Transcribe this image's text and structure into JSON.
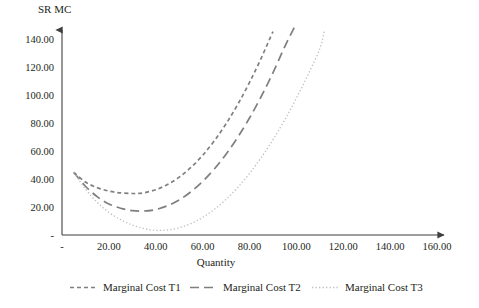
{
  "chart_data": {
    "type": "line",
    "title": "",
    "xlabel": "Quantity",
    "ylabel": "SR MC",
    "xlim": [
      0,
      160
    ],
    "ylim": [
      0,
      150
    ],
    "grid": false,
    "legend_position": "bottom",
    "x_tick_labels": [
      "-",
      "20.00",
      "40.00",
      "60.00",
      "80.00",
      "100.00",
      "120.00",
      "140.00",
      "160.00"
    ],
    "x_tick_values": [
      0,
      20,
      40,
      60,
      80,
      100,
      120,
      140,
      160
    ],
    "y_tick_labels": [
      "-",
      "20.00",
      "40.00",
      "60.00",
      "80.00",
      "100.00",
      "120.00",
      "140.00"
    ],
    "y_tick_values": [
      0,
      20,
      40,
      60,
      80,
      100,
      120,
      140
    ],
    "series": [
      {
        "name": "Marginal Cost T1",
        "dash": "short-dash",
        "color": "#808080",
        "x": [
          5,
          10,
          15,
          20,
          25,
          30,
          32,
          35,
          40,
          45,
          50,
          55,
          60,
          65,
          70,
          75,
          80,
          85,
          90
        ],
        "values": [
          45,
          38,
          34,
          31.5,
          30.2,
          29.8,
          29.8,
          30.3,
          32.5,
          36.2,
          41.5,
          48.5,
          57.2,
          67.6,
          79.8,
          93.8,
          109.5,
          127,
          146
        ]
      },
      {
        "name": "Marginal Cost T2",
        "dash": "long-dash",
        "color": "#7f7f7f",
        "x": [
          5,
          10,
          15,
          20,
          25,
          30,
          35,
          40,
          45,
          50,
          55,
          60,
          65,
          70,
          75,
          80,
          85,
          90,
          95,
          100
        ],
        "values": [
          45,
          35,
          27.5,
          22.3,
          19.2,
          17.5,
          17.2,
          18.3,
          21,
          25.2,
          31,
          38.4,
          47.4,
          58,
          70.2,
          84,
          99.4,
          116.4,
          135,
          152
        ]
      },
      {
        "name": "Marginal Cost T3",
        "dash": "dotted",
        "color": "#bfbfbf",
        "x": [
          5,
          10,
          15,
          20,
          25,
          30,
          35,
          40,
          45,
          50,
          55,
          60,
          65,
          70,
          75,
          80,
          85,
          90,
          95,
          100,
          105,
          110,
          112
        ],
        "values": [
          45,
          33,
          23.5,
          16.2,
          11,
          7.2,
          4.6,
          3.4,
          3.6,
          5.2,
          8.2,
          12.6,
          18.4,
          25.6,
          34.2,
          44.2,
          55.6,
          68.4,
          82.6,
          98.2,
          115.2,
          133.6,
          147
        ]
      }
    ]
  },
  "legend": {
    "items": [
      {
        "label": "Marginal Cost T1"
      },
      {
        "label": "Marginal Cost T2"
      },
      {
        "label": "Marginal Cost T3"
      }
    ]
  }
}
